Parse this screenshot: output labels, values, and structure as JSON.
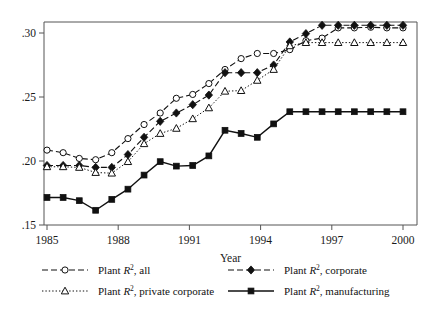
{
  "chart_data": {
    "type": "line",
    "title": "",
    "xlabel": "Year",
    "ylabel": "",
    "xlim": [
      1985,
      2000
    ],
    "ylim": [
      0.15,
      0.3125
    ],
    "grid": false,
    "legend_position": "bottom",
    "xticks": [
      1985,
      1988,
      1991,
      1994,
      1997,
      2000
    ],
    "xticklabels": [
      "1985",
      "1988",
      "1991",
      "1994",
      "1997",
      "2000"
    ],
    "yticks": [
      0.15,
      0.2,
      0.25,
      0.3
    ],
    "yticklabels": [
      ".15",
      ".20",
      ".25",
      ".30"
    ],
    "x": [
      1985.0,
      1985.68,
      1986.36,
      1987.05,
      1987.73,
      1988.41,
      1989.09,
      1989.77,
      1990.45,
      1991.14,
      1991.82,
      1992.5,
      1993.18,
      1993.86,
      1994.55,
      1995.23,
      1995.91,
      1996.59,
      1997.27,
      1997.95,
      1998.64,
      1999.32,
      2000.0
    ],
    "series": [
      {
        "name": "Plant R2, all",
        "legend_label": "Plant R², all",
        "marker": "open-circle",
        "linestyle": "dashed",
        "color": "#111111",
        "values": [
          0.2085,
          0.2065,
          0.202,
          0.201,
          0.2065,
          0.2175,
          0.2285,
          0.2375,
          0.249,
          0.252,
          0.2605,
          0.2715,
          0.28,
          0.284,
          0.284,
          0.287,
          0.294,
          0.296,
          0.304,
          0.304,
          0.3045,
          0.304,
          0.304
        ]
      },
      {
        "name": "Plant R2, corporate",
        "legend_label": "Plant R², corporate",
        "marker": "solid-diamond",
        "linestyle": "dashed",
        "color": "#111111",
        "values": [
          0.1965,
          0.1965,
          0.1965,
          0.195,
          0.195,
          0.205,
          0.2185,
          0.231,
          0.2375,
          0.244,
          0.2515,
          0.269,
          0.269,
          0.269,
          0.275,
          0.293,
          0.2995,
          0.306,
          0.306,
          0.306,
          0.306,
          0.306,
          0.306
        ]
      },
      {
        "name": "Plant R2, private corporate",
        "legend_label": "Plant R², private corporate",
        "marker": "open-triangle",
        "linestyle": "dotted",
        "color": "#111111",
        "values": [
          0.1955,
          0.1955,
          0.195,
          0.191,
          0.1905,
          0.1995,
          0.2135,
          0.2215,
          0.2255,
          0.233,
          0.2415,
          0.2545,
          0.255,
          0.263,
          0.2715,
          0.29,
          0.2925,
          0.2925,
          0.2925,
          0.2925,
          0.2925,
          0.2925,
          0.2925
        ]
      },
      {
        "name": "Plant R2, manufacturing",
        "legend_label": "Plant R², manufacturing",
        "marker": "solid-square",
        "linestyle": "solid",
        "color": "#111111",
        "values": [
          0.1715,
          0.1715,
          0.169,
          0.1615,
          0.17,
          0.178,
          0.189,
          0.1995,
          0.196,
          0.1965,
          0.204,
          0.224,
          0.2215,
          0.2185,
          0.229,
          0.2385,
          0.2385,
          0.2385,
          0.2385,
          0.2385,
          0.2385,
          0.2385,
          0.2385
        ]
      }
    ]
  },
  "legend": {
    "entries": [
      {
        "label": "Plant R",
        "sup": "2",
        "rest": ", all"
      },
      {
        "label": "Plant R",
        "sup": "2",
        "rest": ", corporate"
      },
      {
        "label": "Plant R",
        "sup": "2",
        "rest": ", private corporate"
      },
      {
        "label": "Plant R",
        "sup": "2",
        "rest": ", manufacturing"
      }
    ]
  }
}
